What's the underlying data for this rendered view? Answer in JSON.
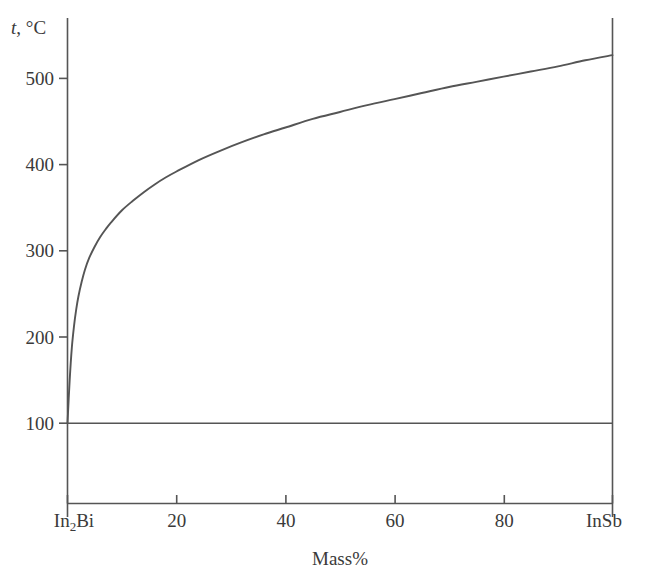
{
  "chart_data": {
    "type": "line",
    "title": "",
    "subtitle": "",
    "xlabel": "Mass%",
    "ylabel": "t, °C",
    "ylabel_parts": {
      "symbol": "t",
      "rest": ", °C"
    },
    "xlim": [
      0,
      100
    ],
    "ylim": [
      0,
      560
    ],
    "grid": false,
    "legend": null,
    "x_tick_values": [
      0,
      20,
      40,
      60,
      80,
      100
    ],
    "x_tick_labels": [
      "In2Bi",
      "20",
      "40",
      "60",
      "80",
      "InSb"
    ],
    "x_endpoint_left_label": {
      "formula": "In",
      "sub": "2",
      "tail": "Bi"
    },
    "x_endpoint_right_label": "InSb",
    "y_tick_values": [
      100,
      200,
      300,
      400,
      500
    ],
    "y_tick_labels": [
      "100",
      "200",
      "300",
      "400",
      "500"
    ],
    "line_color": "#555555",
    "axis_color": "#555555",
    "series": [
      {
        "name": "liquidus",
        "type": "curve",
        "x": [
          0,
          0.4,
          0.8,
          1.2,
          1.6,
          2,
          2.6,
          3.2,
          4,
          5,
          6,
          7,
          8,
          10,
          12,
          14,
          16,
          18,
          20,
          24,
          28,
          32,
          36,
          40,
          45,
          50,
          55,
          60,
          65,
          70,
          75,
          80,
          85,
          90,
          95,
          100
        ],
        "y": [
          100,
          150,
          188,
          213,
          232,
          247,
          264,
          278,
          292,
          305,
          316,
          325,
          333,
          347,
          358,
          368,
          377,
          385,
          392,
          405,
          416,
          426,
          435,
          443,
          453,
          461,
          469,
          476,
          483,
          490,
          496,
          502,
          508,
          514,
          521,
          527
        ]
      },
      {
        "name": "invariant-horizontal",
        "type": "horizontal-line",
        "y_value": 100,
        "x_start": 0,
        "x_end": 100
      }
    ]
  },
  "axes": {
    "left_axis_name": "temperature-axis",
    "bottom_axis_name": "composition-axis",
    "right_axis_name": "right-composition-boundary"
  }
}
